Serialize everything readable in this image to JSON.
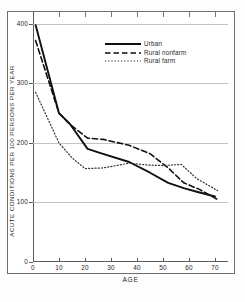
{
  "chart_data": {
    "type": "line",
    "title": "",
    "xlabel": "AGE",
    "ylabel": "ACUTE CONDITIONS PER 100 PERSONS PER YEAR",
    "xlim": [
      0,
      75
    ],
    "ylim": [
      0,
      420
    ],
    "xticks": [
      "0",
      "10",
      "20",
      "30",
      "40",
      "50",
      "60",
      "70"
    ],
    "xtick_values": [
      0,
      10,
      20,
      30,
      40,
      50,
      60,
      70
    ],
    "yticks": [
      "0",
      "100",
      "200",
      "300",
      "400"
    ],
    "ytick_values": [
      0,
      100,
      200,
      300,
      400
    ],
    "grid": "horizontal",
    "legend_position": "upper-center",
    "series": [
      {
        "name": "Urban",
        "style": "solid",
        "color": "#111111",
        "x": [
          1,
          10,
          14,
          21,
          26,
          37,
          45,
          52,
          58,
          63,
          70
        ],
        "values": [
          398,
          250,
          233,
          190,
          183,
          168,
          150,
          133,
          124,
          118,
          110
        ]
      },
      {
        "name": "Rural nonfarm",
        "style": "dashed",
        "color": "#111111",
        "x": [
          1,
          10,
          14,
          21,
          27,
          37,
          45,
          52,
          58,
          64,
          71
        ],
        "values": [
          372,
          250,
          232,
          208,
          206,
          196,
          182,
          158,
          133,
          122,
          105
        ]
      },
      {
        "name": "Rural farm",
        "style": "dotted",
        "color": "#333333",
        "x": [
          1,
          10,
          15,
          20,
          27,
          37,
          44,
          50,
          57,
          63,
          71
        ],
        "values": [
          285,
          200,
          175,
          157,
          158,
          166,
          163,
          162,
          164,
          140,
          120
        ]
      }
    ]
  },
  "legend": {
    "items": [
      {
        "label": "Urban",
        "style": "solid"
      },
      {
        "label": "Rural nonfarm",
        "style": "dashed"
      },
      {
        "label": "Rural farm",
        "style": "dotted"
      }
    ]
  }
}
